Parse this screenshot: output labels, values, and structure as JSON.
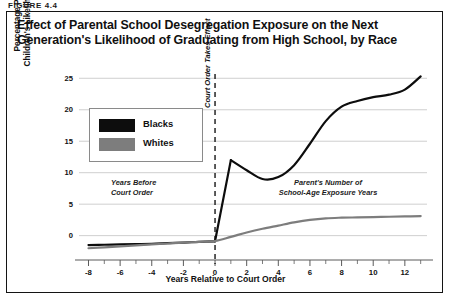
{
  "figure_label": "FIGURE 4.4",
  "title": "Effect of Parental School Desegregation Exposure on the Next Generation's Likelihood of Graduating from High School, by Race",
  "legend": {
    "items": [
      {
        "label": "Blacks",
        "color": "#0d0d0d"
      },
      {
        "label": "Whites",
        "color": "#7d7d7d"
      }
    ]
  },
  "annotations": {
    "left_line1": "Years Before",
    "left_line2": "Court Order",
    "right_line1": "Parent's Number of",
    "right_line2": "School-Age Exposure Years",
    "vline": "Court Order Takes Effect"
  },
  "chart_data": {
    "type": "line",
    "title": "Effect of Parental School Desegregation Exposure on the Next Generation's Likelihood of Graduating from High School, by Race",
    "xlabel": "Years Relative to Court Order",
    "ylabel": "Percentage Point Change in Children's Likelihood of Graduation",
    "xlim": [
      -8.6,
      13.4
    ],
    "ylim": [
      -2.6,
      26.0
    ],
    "xticks": [
      -8,
      -6,
      -4,
      -2,
      0,
      2,
      4,
      6,
      8,
      10,
      12
    ],
    "xtick_labels": [
      "-8",
      "-6",
      "-4",
      "-2",
      "0",
      "2",
      "4",
      "6",
      "8",
      "10",
      "12"
    ],
    "yticks": [
      0,
      5,
      10,
      15,
      20,
      25
    ],
    "ytick_labels": [
      "0",
      "5",
      "10",
      "15",
      "20",
      "25"
    ],
    "grid": "horizontal",
    "minor_xticks_step": 1,
    "legend_position": "upper-left-inside",
    "vline": {
      "x": 0,
      "style": "dashed",
      "label": "Court Order Takes Effect"
    },
    "series": [
      {
        "name": "Blacks",
        "color": "#0d0d0d",
        "x": [
          -8,
          -7,
          -6,
          -5,
          -4,
          -3,
          -2,
          -1,
          0,
          1,
          2,
          3,
          4,
          5,
          6,
          7,
          8,
          9,
          10,
          11,
          12,
          13
        ],
        "y": [
          -1.5,
          -1.45,
          -1.4,
          -1.35,
          -1.3,
          -1.2,
          -1.1,
          -1.0,
          -0.9,
          12.0,
          10.4,
          9.0,
          9.3,
          11.2,
          14.6,
          18.2,
          20.5,
          21.4,
          22.0,
          22.4,
          23.2,
          25.3
        ]
      },
      {
        "name": "Whites",
        "color": "#7d7d7d",
        "x": [
          -8,
          -7,
          -6,
          -5,
          -4,
          -3,
          -2,
          -1,
          0,
          1,
          2,
          3,
          4,
          5,
          6,
          7,
          8,
          9,
          10,
          11,
          12,
          13
        ],
        "y": [
          -2.0,
          -1.85,
          -1.7,
          -1.55,
          -1.4,
          -1.25,
          -1.1,
          -1.0,
          -0.85,
          -0.2,
          0.5,
          1.1,
          1.6,
          2.1,
          2.5,
          2.75,
          2.85,
          2.9,
          2.95,
          3.0,
          3.05,
          3.1
        ]
      }
    ]
  }
}
